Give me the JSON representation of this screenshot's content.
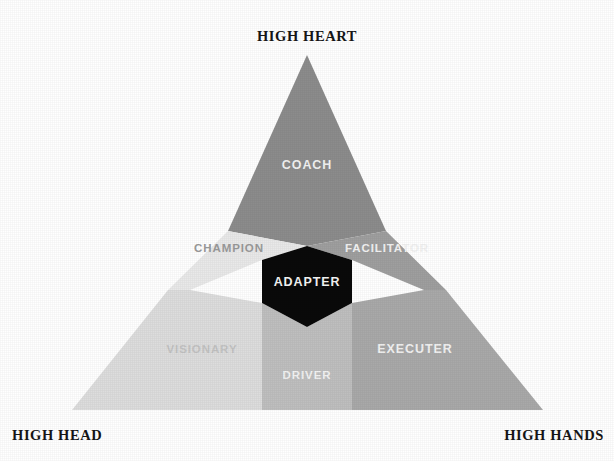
{
  "diagram": {
    "type": "triangle-segmentation",
    "background_color": "#ffffff",
    "corners": {
      "top": {
        "label": "HIGH HEART",
        "vertex": [
          307,
          55
        ]
      },
      "bottom_left": {
        "label": "HIGH HEAD",
        "vertex": [
          72,
          410
        ]
      },
      "bottom_right": {
        "label": "HIGH HANDS",
        "vertex": [
          543,
          410
        ]
      }
    },
    "zones": [
      {
        "id": "coach",
        "label": "COACH",
        "fill": "#8c8c8c",
        "text_color": "#f2f2f2",
        "label_x": 307,
        "label_y": 166,
        "points": "307,55 386,231 307,246 228,231"
      },
      {
        "id": "champion",
        "label": "CHAMPION",
        "fill": "#e9e9e9",
        "text_color": "#9a9a9a",
        "label_x": 229,
        "label_y": 249,
        "points": "228,231 307,246 262,260 190,290 168,290"
      },
      {
        "id": "facilitator",
        "label": "FACILITATOR",
        "fill": "#9f9f9f",
        "text_color": "#f2f2f2",
        "label_x": 387,
        "label_y": 249,
        "points": "386,231 446,290 424,290 352,260 307,246"
      },
      {
        "id": "visionary",
        "label": "VISIONARY",
        "fill": "#dddddd",
        "text_color": "#c3c3c3",
        "label_x": 202,
        "label_y": 350,
        "points": "168,290 190,290 262,303 262,410 72,410"
      },
      {
        "id": "driver",
        "label": "DRIVER",
        "fill": "#bfbfbf",
        "text_color": "#f2f2f2",
        "label_x": 307,
        "label_y": 376,
        "points": "262,303 307,327 352,303 352,410 262,410"
      },
      {
        "id": "executer",
        "label": "EXECUTER",
        "fill": "#a9a9a9",
        "text_color": "#f2f2f2",
        "label_x": 415,
        "label_y": 350,
        "points": "424,290 446,290 543,410 352,410 352,303"
      },
      {
        "id": "adapter",
        "label": "ADAPTER",
        "fill": "#0a0a0a",
        "text_color": "#f4f4f4",
        "label_x": 307,
        "label_y": 283,
        "points": "262,260 307,246 352,260 352,303 307,327 262,303"
      }
    ]
  }
}
